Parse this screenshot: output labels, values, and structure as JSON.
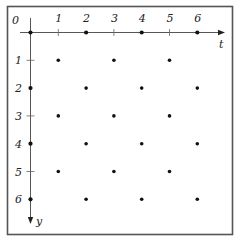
{
  "frame": {
    "border_color": "#555555"
  },
  "axes": {
    "origin_label": "0",
    "t_axis": {
      "label": "t",
      "ticks": [
        "1",
        "2",
        "3",
        "4",
        "5",
        "6"
      ]
    },
    "y_axis": {
      "label": "y",
      "ticks": [
        "1",
        "2",
        "3",
        "4",
        "5",
        "6"
      ]
    }
  },
  "lattice": {
    "description": "Checkerboard lattice points (t, y) where t + y is even",
    "points": [
      [
        0,
        0
      ],
      [
        2,
        0
      ],
      [
        4,
        0
      ],
      [
        6,
        0
      ],
      [
        1,
        1
      ],
      [
        3,
        1
      ],
      [
        5,
        1
      ],
      [
        0,
        2
      ],
      [
        2,
        2
      ],
      [
        4,
        2
      ],
      [
        6,
        2
      ],
      [
        1,
        3
      ],
      [
        3,
        3
      ],
      [
        5,
        3
      ],
      [
        0,
        4
      ],
      [
        2,
        4
      ],
      [
        4,
        4
      ],
      [
        6,
        4
      ],
      [
        1,
        5
      ],
      [
        3,
        5
      ],
      [
        5,
        5
      ],
      [
        0,
        6
      ],
      [
        2,
        6
      ],
      [
        4,
        6
      ],
      [
        6,
        6
      ]
    ],
    "dot_color": "#111111"
  }
}
